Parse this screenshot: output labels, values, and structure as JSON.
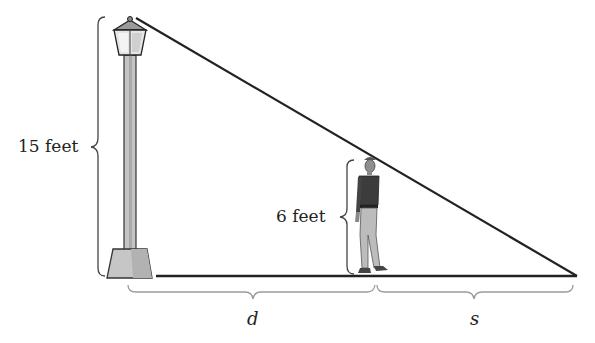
{
  "diagram": {
    "labels": {
      "lamp_height": "15 feet",
      "person_height": "6 feet",
      "distance": "d",
      "shadow": "s"
    },
    "colors": {
      "line": "#222222",
      "brace": "#9a9a9a",
      "lamp_fill": "#c8c8c8",
      "base_fill": "#bdbdbd"
    },
    "geometry": {
      "lamp_top": [
        130,
        18
      ],
      "lamp_base_x": 130,
      "ground_y": 276,
      "person_x": 372,
      "person_head_y": 160,
      "shadow_tip": [
        577,
        276
      ]
    }
  }
}
